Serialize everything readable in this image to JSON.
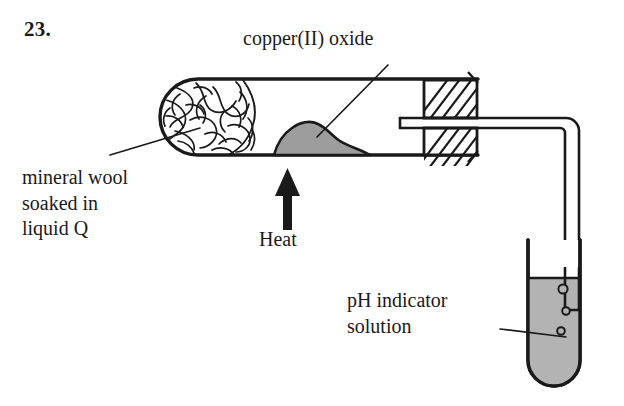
{
  "figure": {
    "question_number": "23."
  },
  "labels": {
    "copper_oxide": "copper(II) oxide",
    "mineral_wool": "mineral wool\nsoaked in\nliquid Q",
    "heat": "Heat",
    "ph_indicator": "pH indicator\nsolution"
  },
  "colors": {
    "ink": "#1a1a1a",
    "copper_oxide_fill": "#9d9d9d",
    "indicator_solution_fill": "#b3b3b3",
    "background": "#ffffff",
    "stopper_fill": "#ffffff"
  },
  "apparatus": {
    "horizontal_test_tube": {
      "name": "horizontal test tube",
      "contents": [
        "mineral wool soaked in liquid Q",
        "copper(II) oxide"
      ]
    },
    "stopper": {
      "name": "hatched rubber stopper with delivery tube"
    },
    "delivery_tube": {
      "name": "bent delivery tube"
    },
    "receiving_test_tube": {
      "name": "vertical test tube of pH indicator solution",
      "bubble_count": 3
    },
    "heat_arrow": {
      "name": "heat arrow",
      "direction": "up"
    }
  }
}
